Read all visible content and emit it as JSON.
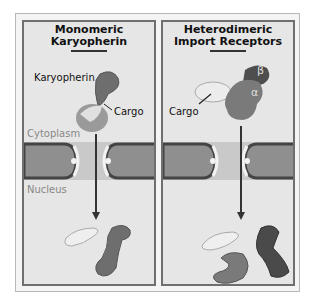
{
  "panels": [
    {
      "title_line1": "Monomeric",
      "title_line2": "Karyopherin",
      "labels": {
        "receptor": "Karyopherin",
        "cargo": "Cargo"
      },
      "regions": {
        "top": "Cytoplasm",
        "bottom": "Nucleus"
      }
    },
    {
      "title_line1": "Heterodimeric",
      "title_line2": "Import Receptors",
      "labels": {
        "alpha": "α",
        "beta": "β",
        "cargo": "Cargo"
      }
    }
  ],
  "colors": {
    "panel_bg": "#e6e6e6",
    "membrane": "#8f8f8f",
    "membrane_edge": "#444444",
    "receptor_dark": "#5a5a5a",
    "receptor_mid": "#7a7a7a",
    "cargo": "#eeeeee"
  }
}
